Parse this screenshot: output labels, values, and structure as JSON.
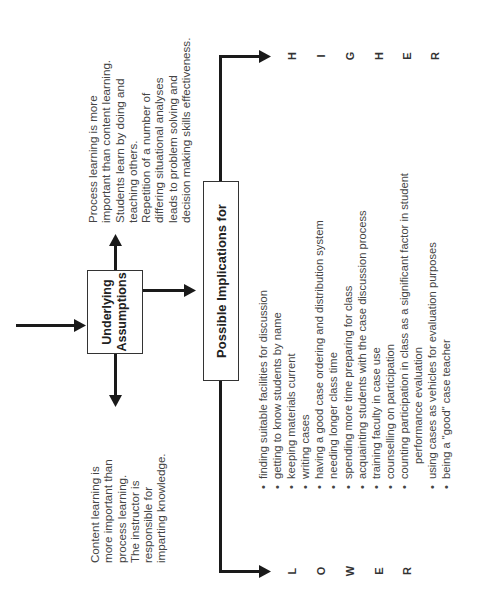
{
  "diagram": {
    "center_box": {
      "label_line1": "Underlying",
      "label_line2": "Assumptions"
    },
    "left_assumption": {
      "lines": [
        "Content learning is",
        "more important than",
        "process learning.",
        "The instructor is",
        "responsible for",
        "imparting knowledge."
      ]
    },
    "right_assumption": {
      "lines": [
        "Process learning is more",
        "important than content learning.",
        "Students learn by doing and",
        "teaching others.",
        "Repetition of a number of",
        "differing situational analyses",
        "leads to problem solving and",
        "decision making skills effectiveness."
      ]
    },
    "implications_box": {
      "label": "Possible Implications for"
    },
    "implications": [
      {
        "text": "finding suitable facilities for discussion",
        "bullet": true
      },
      {
        "text": "getting to know students by name",
        "bullet": true
      },
      {
        "text": "keeping materials current",
        "bullet": true
      },
      {
        "text": "writing cases",
        "bullet": true
      },
      {
        "text": "having a good case ordering and distribution system",
        "bullet": true
      },
      {
        "text": "needing longer class time",
        "bullet": true
      },
      {
        "text": "spending more time preparing for class",
        "bullet": true
      },
      {
        "text": "acquainting students with the case discussion process",
        "bullet": true
      },
      {
        "text": "training faculty in case use",
        "bullet": true
      },
      {
        "text": "counselling on participation",
        "bullet": true
      },
      {
        "text": "counting participation in class as a significant factor in student",
        "bullet": true
      },
      {
        "text": "performance evaluation",
        "bullet": false
      },
      {
        "text": "using cases as vehicles for evaluation purposes",
        "bullet": true
      },
      {
        "text": "being a \"good\" case teacher",
        "bullet": true
      }
    ],
    "bullet_char": "•",
    "scale": {
      "lower": [
        "L",
        "O",
        "W",
        "E",
        "R"
      ],
      "higher": [
        "H",
        "I",
        "G",
        "H",
        "E",
        "R"
      ]
    },
    "colors": {
      "line": "#1a1a1a",
      "text": "#444444",
      "box_border": "#333333"
    }
  }
}
